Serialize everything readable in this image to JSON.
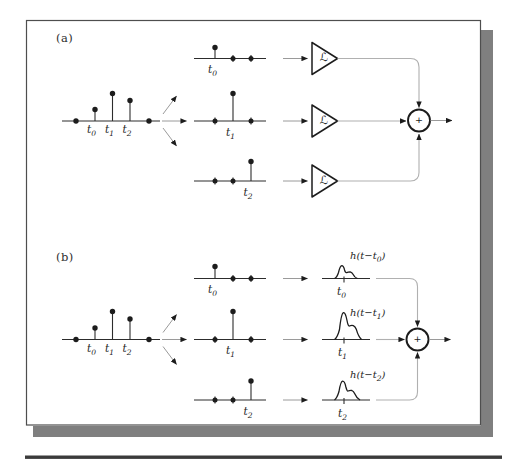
{
  "figure": {
    "type": "signal-decomposition-block-diagram",
    "panels": {
      "a": {
        "tag": "(a)",
        "system_label": "ℒ",
        "adder_label": "+"
      },
      "b": {
        "tag": "(b)",
        "adder_label": "+",
        "response_labels": {
          "h0": {
            "pre": "h(t−t",
            "sub": "0",
            "post": ")"
          },
          "h1": {
            "pre": "h(t−t",
            "sub": "1",
            "post": ")"
          },
          "h2": {
            "pre": "h(t−t",
            "sub": "2",
            "post": ")"
          }
        }
      }
    },
    "time_labels": {
      "t0": {
        "pre": "t",
        "sub": "0"
      },
      "t1": {
        "pre": "t",
        "sub": "1"
      },
      "t2": {
        "pre": "t",
        "sub": "2"
      }
    },
    "input_signal": {
      "impulse_times": [
        "t0",
        "t1",
        "t2"
      ],
      "relative_amplitudes": [
        0.41,
        1.0,
        0.74
      ],
      "zero_samples_at_axis_ends": true
    },
    "colors": {
      "ink": "#1c1c1c",
      "connector": "#b0b0b0",
      "arrow_line": "#9a9a9a",
      "card_border": "#4e4e4e",
      "shadow": "#7f7f7f",
      "bottom_rule": "#3b3b3b",
      "background": "#ffffff"
    }
  }
}
